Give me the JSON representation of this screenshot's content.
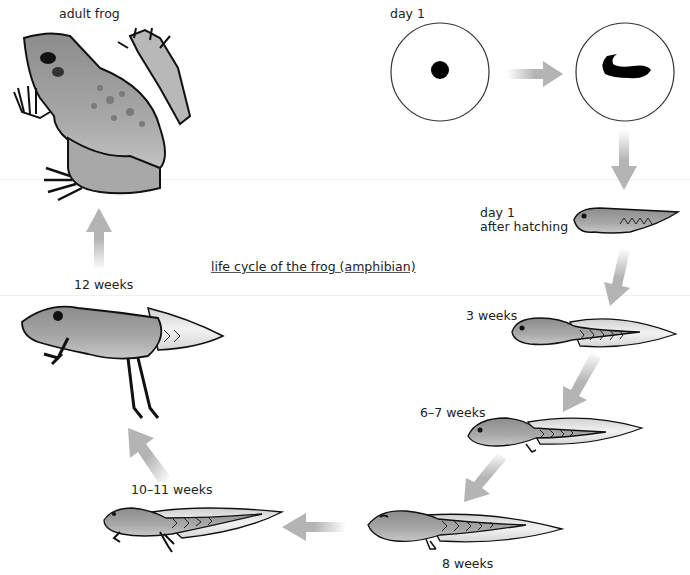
{
  "diagram": {
    "title": "life cycle of the frog (amphibian)",
    "stages": [
      {
        "id": "adult",
        "label": "adult frog"
      },
      {
        "id": "egg",
        "label": "day 1"
      },
      {
        "id": "embryo",
        "label": ""
      },
      {
        "id": "hatchling",
        "label_line1": "day 1",
        "label_line2": "after hatching"
      },
      {
        "id": "tadpole3",
        "label": "3 weeks"
      },
      {
        "id": "tadpole6",
        "label": "6–7 weeks"
      },
      {
        "id": "tadpole8",
        "label": "8 weeks"
      },
      {
        "id": "tadpole10",
        "label": "10–11 weeks"
      },
      {
        "id": "froglet12",
        "label": "12 weeks"
      }
    ],
    "arrows": [
      {
        "from": "egg",
        "to": "embryo",
        "direction": "right"
      },
      {
        "from": "embryo",
        "to": "hatchling",
        "direction": "down"
      },
      {
        "from": "hatchling",
        "to": "tadpole3",
        "direction": "down-left"
      },
      {
        "from": "tadpole3",
        "to": "tadpole6",
        "direction": "down-left"
      },
      {
        "from": "tadpole6",
        "to": "tadpole8",
        "direction": "down-left"
      },
      {
        "from": "tadpole8",
        "to": "tadpole10",
        "direction": "left"
      },
      {
        "from": "tadpole10",
        "to": "froglet12",
        "direction": "up-left"
      },
      {
        "from": "froglet12",
        "to": "adult",
        "direction": "up"
      }
    ],
    "colors": {
      "arrow": "#b4b4b4",
      "body": "#9a9a9a",
      "fin": "#e2e2e2",
      "outline": "#1a1a1a"
    }
  }
}
